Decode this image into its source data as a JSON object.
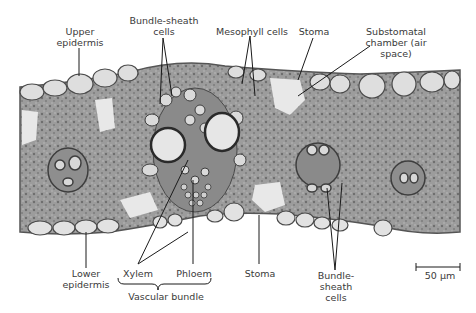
{
  "figure": {
    "labels": {
      "upper_epidermis": "Upper\nepidermis",
      "bundle_sheath_top": "Bundle-sheath\ncells",
      "mesophyll": "Mesophyll cells",
      "stoma_top": "Stoma",
      "substomatal": "Substomatal\nchamber (air\nspace)",
      "lower_epidermis": "Lower\nepidermis",
      "xylem": "Xylem",
      "phloem": "Phloem",
      "vascular_bundle": "Vascular bundle",
      "stoma_bottom": "Stoma",
      "bundle_sheath_bottom": "Bundle-\nsheath\ncells",
      "scale_bar": "50 μm"
    },
    "colors": {
      "tissue_dark": "#7a7a7a",
      "tissue_mid": "#9a9a9a",
      "cell_light": "#dcdcdc",
      "cell_outline": "#4a4a4a",
      "leader_line": "#1a1a1a",
      "label_text": "#3a3a3a"
    }
  }
}
